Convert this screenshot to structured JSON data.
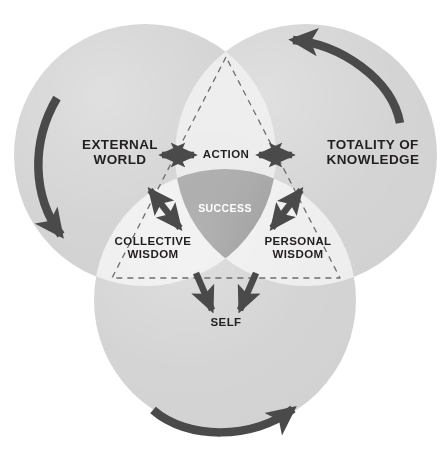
{
  "diagram": {
    "type": "three-circle-venn",
    "colors": {
      "background": "#ffffff",
      "circle_fill": "#d2d2d2",
      "overlap_two": "#e6e6e6",
      "overlap_three": "#8f8f8f",
      "arrow": "#4a4a4a",
      "dashed_line": "#6e6e6e",
      "text": "#231f20",
      "text_inverse": "#ffffff"
    },
    "circles": [
      {
        "id": "external-world",
        "label": "EXTERNAL\nWORLD",
        "cx": 145,
        "cy": 155,
        "r": 131
      },
      {
        "id": "totality-of-knowledge",
        "label": "TOTALITY OF\nKNOWLEDGE",
        "cx": 306,
        "cy": 155,
        "r": 131
      },
      {
        "id": "self",
        "label": "SELF",
        "cx": 225,
        "cy": 300,
        "r": 131
      }
    ],
    "labels": {
      "external_world": "EXTERNAL\nWORLD",
      "totality_of_knowledge": "TOTALITY OF\nKNOWLEDGE",
      "self": "SELF",
      "action": "ACTION",
      "collective_wisdom": "COLLECTIVE\nWISDOM",
      "personal_wisdom": "PERSONAL\nWISDOM",
      "success": "SUCCESS"
    },
    "overlaps": [
      {
        "id": "action",
        "label": "ACTION",
        "between": [
          "EXTERNAL WORLD",
          "TOTALITY OF KNOWLEDGE"
        ]
      },
      {
        "id": "collective-wisdom",
        "label": "COLLECTIVE WISDOM",
        "between": [
          "EXTERNAL WORLD",
          "SELF"
        ]
      },
      {
        "id": "personal-wisdom",
        "label": "PERSONAL WISDOM",
        "between": [
          "TOTALITY OF KNOWLEDGE",
          "SELF"
        ]
      },
      {
        "id": "success",
        "label": "SUCCESS",
        "between": [
          "EXTERNAL WORLD",
          "TOTALITY OF KNOWLEDGE",
          "SELF"
        ]
      }
    ],
    "connectors": [
      {
        "id": "external-world-to-action",
        "style": "double-headed-straight",
        "orientation": "horizontal"
      },
      {
        "id": "action-to-totality",
        "style": "double-headed-straight",
        "orientation": "horizontal"
      },
      {
        "id": "external-world-to-collective-wisdom",
        "style": "double-headed-straight",
        "orientation": "diagonal"
      },
      {
        "id": "totality-to-personal-wisdom",
        "style": "double-headed-straight",
        "orientation": "diagonal"
      },
      {
        "id": "collective-wisdom-to-self",
        "style": "single-headed-straight",
        "orientation": "diagonal"
      },
      {
        "id": "personal-wisdom-to-self",
        "style": "single-headed-straight",
        "orientation": "diagonal"
      }
    ],
    "cycle_arrows": [
      {
        "id": "external-world-cycle-arrow",
        "direction": "clockwise-descending",
        "position": "left"
      },
      {
        "id": "totality-cycle-arrow",
        "direction": "counter-clockwise",
        "position": "top-right"
      },
      {
        "id": "self-cycle-arrow",
        "direction": "clockwise-ascending",
        "position": "bottom"
      }
    ],
    "guide": {
      "id": "dashed-triangle",
      "style": "dashed",
      "vertices": [
        [
          226,
          57
        ],
        [
          112,
          278
        ],
        [
          340,
          278
        ]
      ]
    }
  }
}
